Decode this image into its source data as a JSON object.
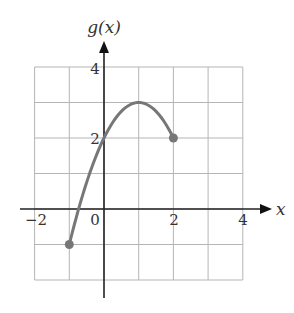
{
  "chart_data": {
    "type": "line",
    "title": "",
    "xlabel": "x",
    "ylabel": "g(x)",
    "xlim": [
      -2,
      4
    ],
    "ylim": [
      -2,
      4
    ],
    "grid": true,
    "x_tick_labels": [
      "-2",
      "0",
      "2",
      "4"
    ],
    "x_ticks": [
      -2,
      0,
      2,
      4
    ],
    "y_tick_labels": [
      "2",
      "4"
    ],
    "y_ticks": [
      2,
      4
    ],
    "series": [
      {
        "name": "g(x)",
        "function": "3 - (x - 1)^2",
        "domain": [
          -1,
          2
        ],
        "x": [
          -1,
          -0.5,
          0,
          0.5,
          1,
          1.5,
          2
        ],
        "values": [
          -1,
          0.75,
          2,
          2.75,
          3,
          2.75,
          2
        ],
        "endpoints": [
          {
            "x": -1,
            "y": -1,
            "closed": true
          },
          {
            "x": 2,
            "y": 2,
            "closed": true
          }
        ],
        "color": "#777777"
      }
    ]
  },
  "labels": {
    "x_axis": "x",
    "y_axis": "g(x)",
    "x_ticks": [
      "−2",
      "0",
      "2",
      "4"
    ],
    "y_ticks": [
      "2",
      "4"
    ]
  },
  "colors": {
    "grid": "#b5b5b5",
    "axis": "#222222",
    "curve": "#777777"
  }
}
